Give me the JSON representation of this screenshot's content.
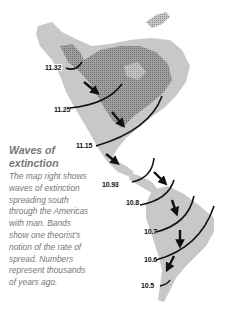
{
  "map": {
    "title": "Waves of extinction",
    "caption": "The map right shows waves of extinction spreading south through the Americas with man. Bands show one theorist's notion of the rate of spread. Numbers represent thousands of years ago.",
    "bands": [
      {
        "label": "11.32"
      },
      {
        "label": "11.25"
      },
      {
        "label": "11.15"
      },
      {
        "label": "10.93"
      },
      {
        "label": "10.8"
      },
      {
        "label": "10.7"
      },
      {
        "label": "10.6"
      },
      {
        "label": "10.5"
      }
    ],
    "colors": {
      "land": "#c8c8c8",
      "ice": "#9a9a9a",
      "band": "#111111",
      "text": "#777777"
    }
  }
}
